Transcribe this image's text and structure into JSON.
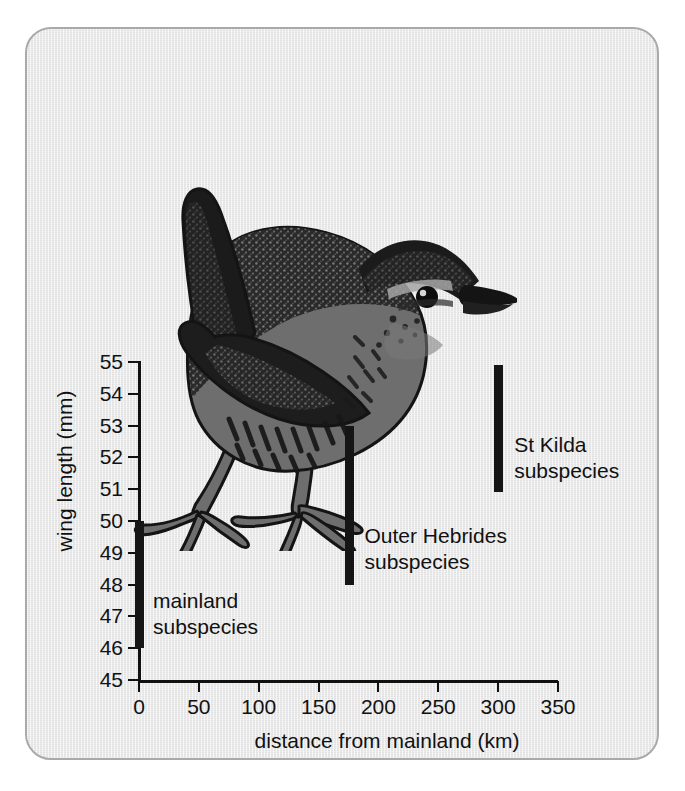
{
  "figure": {
    "illustration_name": "wren-bird-illustration",
    "illustration_alt": "Wren (Troglodytes troglodytes) in profile with cocked tail"
  },
  "colors": {
    "panel_background": "#e9e9e9",
    "panel_border": "#a9a9a9",
    "axis": "#101010",
    "bar": "#151515",
    "bird_dark": "#1a1a1a",
    "bird_mid": "#6e6e6e",
    "page_background": "#ffffff"
  },
  "chart_data": {
    "type": "bar",
    "title": "",
    "xlabel": "distance from mainland (km)",
    "ylabel": "wing length (mm)",
    "xlim": [
      0,
      350
    ],
    "ylim": [
      45,
      55
    ],
    "xticks": [
      0,
      50,
      100,
      150,
      200,
      250,
      300,
      350
    ],
    "yticks": [
      45,
      46,
      47,
      48,
      49,
      50,
      51,
      52,
      53,
      54,
      55
    ],
    "xtick_labels": [
      "0",
      "50",
      "100",
      "150",
      "200",
      "250",
      "300",
      "350"
    ],
    "ytick_labels": [
      "45",
      "46",
      "47",
      "48",
      "49",
      "50",
      "51",
      "52",
      "53",
      "54",
      "55"
    ],
    "grid": false,
    "legend": "none",
    "series": [
      {
        "name": "mainland subspecies",
        "label": "mainland\nsubspecies",
        "label_line1": "mainland",
        "label_line2": "subspecies",
        "x": 0,
        "y_min": 46.0,
        "y_max": 50.0
      },
      {
        "name": "Outer Hebrides subspecies",
        "label": "Outer Hebrides\nsubspecies",
        "label_line1": "Outer Hebrides",
        "label_line2": "subspecies",
        "x": 175,
        "y_min": 48.0,
        "y_max": 53.0
      },
      {
        "name": "St Kilda subspecies",
        "label": "St Kilda\nsubspecies",
        "label_line1": "St Kilda",
        "label_line2": "subspecies",
        "x": 300,
        "y_min": 50.9,
        "y_max": 54.9
      }
    ]
  }
}
